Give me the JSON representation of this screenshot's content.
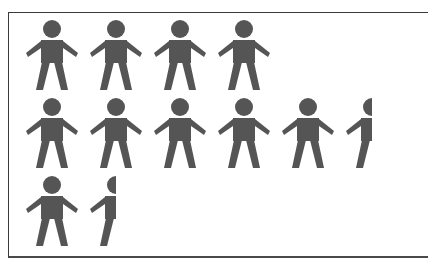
{
  "chart_data": {
    "type": "pictograph",
    "title": "",
    "icon": "person-icon",
    "icon_color": "#555555",
    "categories": [
      "Row 1",
      "Row 2",
      "Row 3"
    ],
    "values": [
      4,
      5.5,
      1.5
    ],
    "rows": [
      {
        "full": 4,
        "partial": 0
      },
      {
        "full": 5,
        "partial": 0.5
      },
      {
        "full": 1,
        "partial": 0.5
      }
    ],
    "legend": [],
    "xlabel": "",
    "ylabel": ""
  }
}
